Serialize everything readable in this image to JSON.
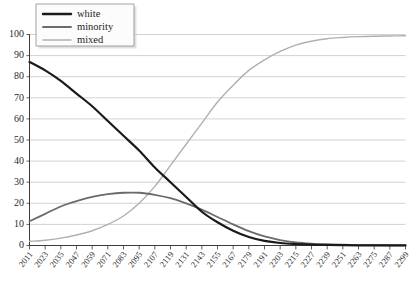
{
  "chart_data": {
    "type": "line",
    "title": "",
    "subtitle": "",
    "xlabel": "",
    "ylabel": "",
    "xlim": [
      2011,
      2299
    ],
    "ylim": [
      0,
      100
    ],
    "grid": true,
    "legend_position": "top-left",
    "x_tick_labels": [
      "2011",
      "2023",
      "2035",
      "2047",
      "2059",
      "2071",
      "2083",
      "2095",
      "2107",
      "2119",
      "2131",
      "2143",
      "2155",
      "2167",
      "2179",
      "2191",
      "2203",
      "2215",
      "2227",
      "2239",
      "2251",
      "2263",
      "2275",
      "2287",
      "2299"
    ],
    "y_tick_labels": [
      "0",
      "10",
      "20",
      "30",
      "40",
      "50",
      "60",
      "70",
      "80",
      "90",
      "100"
    ],
    "x": [
      2011,
      2023,
      2035,
      2047,
      2059,
      2071,
      2083,
      2095,
      2107,
      2119,
      2131,
      2143,
      2155,
      2167,
      2179,
      2191,
      2203,
      2215,
      2227,
      2239,
      2251,
      2263,
      2275,
      2287,
      2299
    ],
    "series": [
      {
        "name": "white",
        "color": "#1a1a1a",
        "width": 2.2,
        "values": [
          87,
          83,
          78,
          72,
          66,
          59,
          52,
          45,
          37,
          30,
          23,
          16,
          11,
          7,
          4,
          2.2,
          1.2,
          0.7,
          0.4,
          0.25,
          0.15,
          0.1,
          0.07,
          0.05,
          0.03
        ]
      },
      {
        "name": "minority",
        "color": "#6b6b6b",
        "width": 1.8,
        "values": [
          11.5,
          15,
          18.5,
          21,
          23,
          24.3,
          25,
          25,
          24,
          22.4,
          20,
          17,
          13.5,
          10,
          6.8,
          4.3,
          2.6,
          1.5,
          0.9,
          0.55,
          0.35,
          0.22,
          0.15,
          0.1,
          0.07
        ]
      },
      {
        "name": "mixed",
        "color": "#b0b0b0",
        "width": 1.4,
        "values": [
          2,
          2.5,
          3.5,
          5,
          7,
          10,
          14,
          20,
          28,
          38,
          48,
          58,
          68,
          76,
          83,
          88,
          92,
          95,
          96.8,
          98,
          98.6,
          99,
          99.2,
          99.3,
          99.4
        ]
      }
    ],
    "legend": [
      {
        "label": "white",
        "color": "#1a1a1a",
        "width": 2.4
      },
      {
        "label": "minority",
        "color": "#6b6b6b",
        "width": 1.9
      },
      {
        "label": "mixed",
        "color": "#b0b0b0",
        "width": 1.4
      }
    ]
  }
}
